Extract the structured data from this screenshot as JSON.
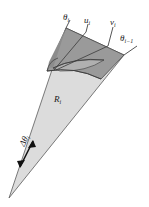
{
  "figure": {
    "name": "angular-wedge-sector-diagram",
    "type": "geometric-diagram",
    "background_color": "#ffffff",
    "canvas": {
      "width": 149,
      "height": 207
    },
    "labels": {
      "theta_i": {
        "text": "θ",
        "sub": "i"
      },
      "u_i": {
        "text": "u",
        "sub": "i"
      },
      "v_i": {
        "text": "v",
        "sub": "i"
      },
      "theta_i_minus_1": {
        "text": "θ",
        "sub": "i−1"
      },
      "R_i": {
        "text": "R",
        "sub": "i"
      },
      "delta_theta_i": {
        "text": "Δθ",
        "sub": "i"
      }
    },
    "colors": {
      "wedge_light_fill": "#dcdcdc",
      "band_dark_fill": "#9a9a9a",
      "band_mid_fill": "#b4b4b4",
      "band_darkest_fill": "#8c8c8c",
      "stroke": "#4a4a4a",
      "leader_line": "#2a2a2a",
      "text": "#1a1a1a"
    },
    "geometry": {
      "apex": {
        "x": 9,
        "y": 198
      },
      "outer_left_corner": {
        "x": 66,
        "y": 28
      },
      "outer_right_corner": {
        "x": 124,
        "y": 55
      },
      "band_inner_left": {
        "x": 47,
        "y": 71
      },
      "band_inner_right": {
        "x": 101,
        "y": 79
      },
      "ray_u_i_outer": {
        "x": 88,
        "y": 30
      },
      "ray_v_i_outer": {
        "x": 110,
        "y": 44
      },
      "angular_width_arrow": {
        "from": {
          "x": 19,
          "y": 168
        },
        "to": {
          "x": 34,
          "y": 139
        }
      }
    }
  }
}
